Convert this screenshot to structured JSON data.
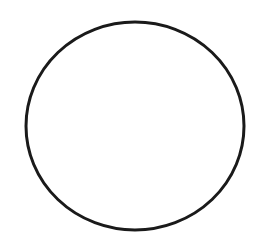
{
  "canvas": {
    "width": 259,
    "height": 250,
    "background": "#ffffff"
  },
  "shapes": [
    {
      "type": "ellipse",
      "name": "circle-outline",
      "cx": 135,
      "cy": 126,
      "rx": 109,
      "ry": 104,
      "stroke": "#1a1a1a",
      "stroke_width": 3,
      "fill": "none"
    }
  ]
}
